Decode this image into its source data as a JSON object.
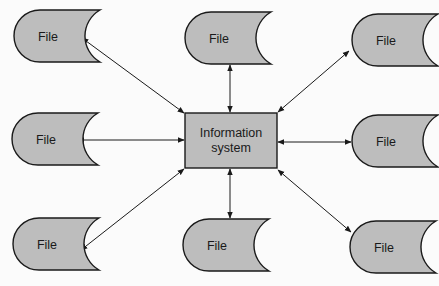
{
  "diagram": {
    "colors": {
      "node_fill": "#bdbdbd",
      "stroke": "#1a1a1a",
      "background": "#fbfbfb"
    },
    "center": {
      "label_line1": "Information",
      "label_line2": "system",
      "x": 185,
      "y": 113,
      "w": 92,
      "h": 55
    },
    "files": [
      {
        "id": "file-top-left",
        "label": "File",
        "x": 14,
        "y": 10
      },
      {
        "id": "file-top-center",
        "label": "File",
        "x": 185,
        "y": 12
      },
      {
        "id": "file-top-right",
        "label": "File",
        "x": 352,
        "y": 14
      },
      {
        "id": "file-middle-left",
        "label": "File",
        "x": 12,
        "y": 113
      },
      {
        "id": "file-middle-right",
        "label": "File",
        "x": 352,
        "y": 115
      },
      {
        "id": "file-bottom-left",
        "label": "File",
        "x": 13,
        "y": 218
      },
      {
        "id": "file-bottom-center",
        "label": "File",
        "x": 183,
        "y": 219
      },
      {
        "id": "file-bottom-right",
        "label": "File",
        "x": 350,
        "y": 221
      }
    ],
    "connections": [
      {
        "from": "file-top-left",
        "to": "center",
        "x1": 82,
        "y1": 38,
        "x2": 184,
        "y2": 113,
        "bidirectional": true
      },
      {
        "from": "file-top-center",
        "to": "center",
        "x1": 230,
        "y1": 65,
        "x2": 230,
        "y2": 112,
        "bidirectional": true
      },
      {
        "from": "file-top-right",
        "to": "center",
        "x1": 349,
        "y1": 51,
        "x2": 278,
        "y2": 112,
        "bidirectional": true
      },
      {
        "from": "file-middle-left",
        "to": "center",
        "x1": 78,
        "y1": 140,
        "x2": 184,
        "y2": 140,
        "bidirectional": true
      },
      {
        "from": "file-middle-right",
        "to": "center",
        "x1": 278,
        "y1": 142,
        "x2": 351,
        "y2": 142,
        "bidirectional": true
      },
      {
        "from": "file-bottom-left",
        "to": "center",
        "x1": 81,
        "y1": 250,
        "x2": 184,
        "y2": 169,
        "bidirectional": true
      },
      {
        "from": "file-bottom-center",
        "to": "center",
        "x1": 230,
        "y1": 169,
        "x2": 230,
        "y2": 218,
        "bidirectional": true
      },
      {
        "from": "file-bottom-right",
        "to": "center",
        "x1": 278,
        "y1": 170,
        "x2": 351,
        "y2": 232,
        "bidirectional": true
      }
    ]
  }
}
